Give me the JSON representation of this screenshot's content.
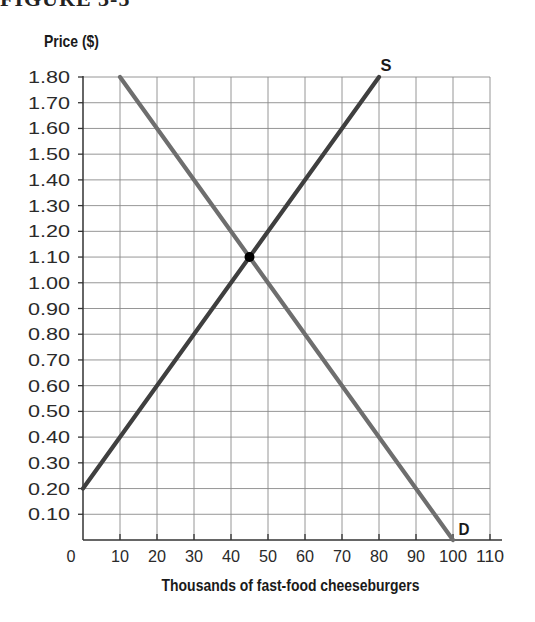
{
  "figure": {
    "title_fragment": "FIGURE 3-5"
  },
  "chart_data": {
    "type": "line",
    "title": "",
    "xlabel": "Thousands of fast-food cheeseburgers",
    "ylabel": "Price ($)",
    "xlim": [
      0,
      110
    ],
    "ylim": [
      0,
      1.8
    ],
    "grid": true,
    "x_ticks": [
      "0",
      "10",
      "20",
      "30",
      "40",
      "50",
      "60",
      "70",
      "80",
      "90",
      "100",
      "110"
    ],
    "y_ticks": [
      "0.10",
      "0.20",
      "0.30",
      "0.40",
      "0.50",
      "0.60",
      "0.70",
      "0.80",
      "0.90",
      "1.00",
      "1.10",
      "1.20",
      "1.30",
      "1.40",
      "1.50",
      "1.60",
      "1.70",
      "1.80"
    ],
    "series": [
      {
        "name": "S",
        "label": "Supply",
        "color": "#3f3f3f",
        "points": [
          [
            0,
            0.2
          ],
          [
            80,
            1.8
          ]
        ]
      },
      {
        "name": "D",
        "label": "Demand",
        "color": "#6e6e6e",
        "points": [
          [
            10,
            1.8
          ],
          [
            100,
            0
          ]
        ]
      }
    ],
    "annotations": [
      {
        "type": "point",
        "label": "equilibrium",
        "x": 45,
        "y": 1.1,
        "color": "#000000"
      },
      {
        "type": "text",
        "text": "S",
        "x": 80,
        "y": 1.8
      },
      {
        "type": "text",
        "text": "D",
        "x": 100,
        "y": 0
      }
    ],
    "legend": "none"
  }
}
